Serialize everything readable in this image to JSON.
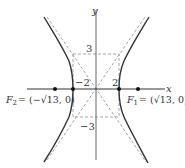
{
  "figure": {
    "axes": {
      "x_label": "x",
      "y_label": "y"
    },
    "tick_labels": {
      "x_pos": "2",
      "x_neg": "−2",
      "y_pos": "3",
      "y_neg": "−3"
    },
    "foci": {
      "f1": {
        "name": "F",
        "sub": "1",
        "coords": "= (√13, 0)"
      },
      "f2": {
        "name": "F",
        "sub": "2",
        "coords": "= (−√13, 0)"
      }
    },
    "colors": {
      "curve": "#333333",
      "axis": "#444444",
      "dashed": "#999999"
    }
  }
}
